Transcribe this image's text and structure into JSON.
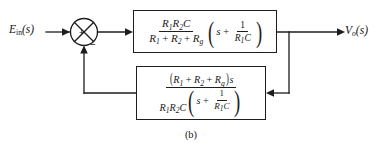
{
  "figure": {
    "caption": "(b)",
    "type": "control-system-block-diagram"
  },
  "signals": {
    "input": {
      "base": "E",
      "subscript": "in",
      "argument": "(s)",
      "full": "E_in(s)"
    },
    "output": {
      "base": "V",
      "subscript": "o",
      "argument": "(s)",
      "full": "V_o(s)"
    }
  },
  "summing_junction": {
    "name": "summing-junction",
    "positive_sign": "+",
    "negative_sign": "−",
    "positive_input": "E_in(s)",
    "negative_input": "feedback"
  },
  "forward_block": {
    "name": "forward-path-transfer-function",
    "fraction": {
      "numerator": {
        "terms": [
          "R",
          "R",
          "C"
        ],
        "subscripts": [
          "1",
          "2",
          ""
        ],
        "text": "R₁R₂C"
      },
      "denominator": {
        "terms": [
          "R",
          "R",
          "R"
        ],
        "subscripts": [
          "1",
          "2",
          "g"
        ],
        "text": "R₁ + R₂ + R_g"
      }
    },
    "parenthetical": {
      "lead": "s",
      "operator": "+",
      "fraction": {
        "numerator": "1",
        "denominator": {
          "text": "R₁C",
          "base": "R",
          "subscript": "1",
          "trailing": "C"
        }
      }
    },
    "full_text": "R1R2C/(R1 + R2 + Rg) (s + 1/(R1C))"
  },
  "feedback_block": {
    "name": "feedback-path-transfer-function",
    "fraction": {
      "numerator": {
        "text": "(R₁ + R₂ + R_g)s",
        "terms": [
          "R",
          "R",
          "R"
        ],
        "subscripts": [
          "1",
          "2",
          "g"
        ],
        "trailing": "s"
      },
      "denominator": {
        "lead": {
          "text": "R₁R₂C",
          "terms": [
            "R",
            "R",
            "C"
          ],
          "subscripts": [
            "1",
            "2",
            ""
          ]
        },
        "parenthetical": {
          "lead": "s",
          "operator": "+",
          "fraction": {
            "numerator": "1",
            "denominator": {
              "text": "R₁C",
              "base": "R",
              "subscript": "1",
              "trailing": "C"
            }
          }
        }
      }
    },
    "full_text": "(R1 + R2 + Rg)s / [R1R2C (s + 1/(R1C))]"
  },
  "symbols": {
    "R": "R",
    "C": "C",
    "s": "s",
    "one": "1",
    "sub1": "1",
    "sub2": "2",
    "subg": "g",
    "plus": "+",
    "paren_open": "(",
    "paren_close": ")"
  },
  "colors": {
    "line": "#1d1d1d",
    "text": "#141414",
    "background": "#ffffff"
  }
}
